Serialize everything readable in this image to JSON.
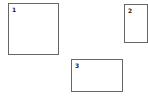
{
  "diagram": {
    "boxes": [
      {
        "label": "1",
        "x": 8,
        "y": 3,
        "w": 51,
        "h": 52
      },
      {
        "label": "2",
        "x": 124,
        "y": 4,
        "w": 24,
        "h": 39
      },
      {
        "label": "3",
        "x": 71,
        "y": 59,
        "w": 52,
        "h": 33
      }
    ],
    "border_color": "#666666",
    "background": "#ffffff"
  }
}
